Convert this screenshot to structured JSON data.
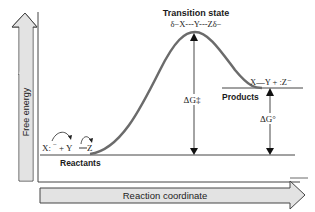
{
  "diagram": {
    "y_axis_label": "Free energy",
    "x_axis_label": "Reaction coordinate",
    "transition_state": {
      "title": "Transition state",
      "formula": "δ−X---Y---Zδ−"
    },
    "reactants": {
      "label": "Reactants",
      "formula_left": "X:",
      "formula_charge": "−",
      "formula_mid": "+ Y",
      "formula_right": "Z"
    },
    "products": {
      "label": "Products",
      "formula": "X—Y + :Z⁻"
    },
    "activation_energy": "ΔG‡",
    "reaction_energy": "ΔG°",
    "colors": {
      "curve": "#6b6b6b",
      "arrow_fill": "#e3e3e3",
      "line": "#444444"
    }
  }
}
